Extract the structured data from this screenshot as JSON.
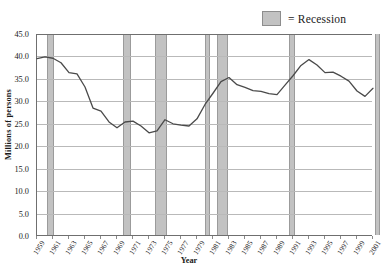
{
  "legend": {
    "label": "= Recession",
    "swatch_color": "#c2c2c2"
  },
  "axes": {
    "ytitle": "Millions of persons",
    "xtitle": "Year",
    "yticks": [
      "0.0",
      "5.0",
      "10.0",
      "15.0",
      "20.0",
      "25.0",
      "30.0",
      "35.0",
      "40.0",
      "45.0"
    ],
    "xticklabels": [
      "1959",
      "1961",
      "1963",
      "1965",
      "1967",
      "1969",
      "1971",
      "1973",
      "1975",
      "1977",
      "1979",
      "1981",
      "1983",
      "1985",
      "1987",
      "1989",
      "1991",
      "1993",
      "1995",
      "1997",
      "1999",
      "2001"
    ]
  },
  "chart_data": {
    "type": "line",
    "title": "",
    "xlabel": "Year",
    "ylabel": "Millions of persons",
    "xlim": [
      1959,
      2001
    ],
    "ylim": [
      0.0,
      45.0
    ],
    "ytick_step": 5.0,
    "grid": true,
    "legend_position": "top-right",
    "line_color": "#4a4a4a",
    "x": [
      1959,
      1960,
      1961,
      1962,
      1963,
      1964,
      1965,
      1966,
      1967,
      1968,
      1969,
      1970,
      1971,
      1972,
      1973,
      1974,
      1975,
      1976,
      1977,
      1978,
      1979,
      1980,
      1981,
      1982,
      1983,
      1984,
      1985,
      1986,
      1987,
      1988,
      1989,
      1990,
      1991,
      1992,
      1993,
      1994,
      1995,
      1996,
      1997,
      1998,
      1999,
      2000,
      2001
    ],
    "series": [
      {
        "name": "Persons below poverty level",
        "values": [
          39.5,
          39.9,
          39.6,
          38.6,
          36.4,
          36.1,
          33.2,
          28.5,
          27.8,
          25.4,
          24.1,
          25.4,
          25.6,
          24.5,
          23.0,
          23.4,
          25.9,
          25.0,
          24.7,
          24.5,
          26.1,
          29.3,
          31.8,
          34.4,
          35.3,
          33.7,
          33.1,
          32.4,
          32.2,
          31.7,
          31.5,
          33.6,
          35.7,
          38.0,
          39.3,
          38.1,
          36.4,
          36.5,
          35.6,
          34.5,
          32.3,
          31.1,
          32.9
        ]
      }
    ],
    "recession_bands": [
      {
        "start": 1960.2,
        "end": 1961.1
      },
      {
        "start": 1969.8,
        "end": 1970.8
      },
      {
        "start": 1973.7,
        "end": 1975.2
      },
      {
        "start": 1980.0,
        "end": 1980.6
      },
      {
        "start": 1981.5,
        "end": 1982.9
      },
      {
        "start": 1990.5,
        "end": 1991.2
      },
      {
        "start": 2001.2,
        "end": 2001.9
      }
    ]
  }
}
